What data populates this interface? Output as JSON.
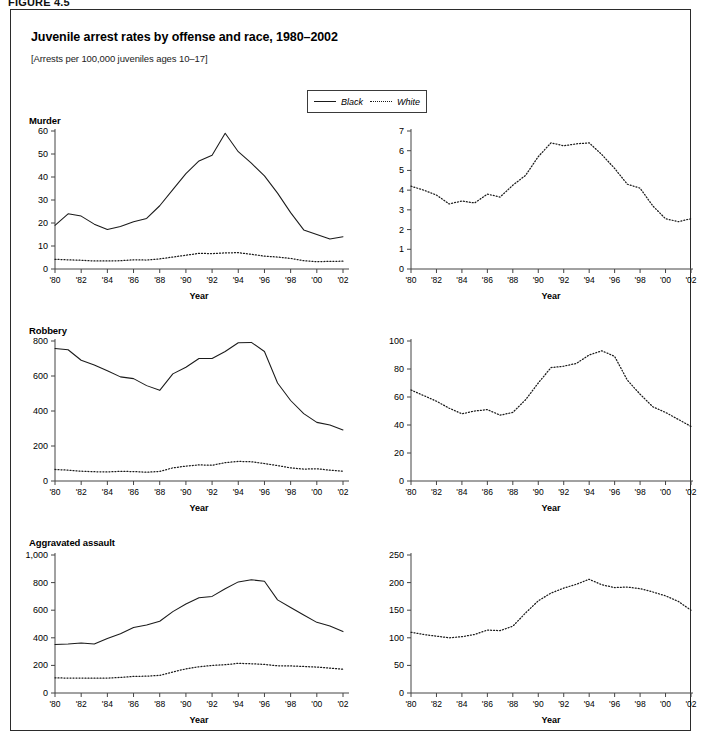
{
  "figure": {
    "label": "FIGURE 4.5",
    "title": "Juvenile arrest rates by offense and race, 1980–2002",
    "subtitle": "[Arrests per 100,000 juveniles ages 10–17]"
  },
  "legend": {
    "position": "top-center",
    "entries": [
      {
        "label": "Black",
        "style": "solid",
        "color": "#1a1a1a"
      },
      {
        "label": "White",
        "style": "dotted",
        "color": "#1a1a1a"
      }
    ]
  },
  "axis": {
    "xlabel": "Year",
    "xticks": [
      "'80",
      "'82",
      "'84",
      "'86",
      "'88",
      "'90",
      "'92",
      "'94",
      "'96",
      "'98",
      "'00",
      "'02"
    ],
    "xtick_years": [
      1980,
      1982,
      1984,
      1986,
      1988,
      1990,
      1992,
      1994,
      1996,
      1998,
      2000,
      2002
    ],
    "xlim": [
      1980,
      2002
    ]
  },
  "chart_data": [
    {
      "id": "murder-both",
      "type": "line",
      "title": "Murder",
      "xlabel": "Year",
      "ylabel": "",
      "ylim": [
        0,
        60
      ],
      "yticks": [
        0,
        10,
        20,
        30,
        40,
        50,
        60
      ],
      "ytick_labels": [
        "0",
        "10",
        "20",
        "30",
        "40",
        "50",
        "60"
      ],
      "grid": false,
      "x": [
        1980,
        1981,
        1982,
        1983,
        1984,
        1985,
        1986,
        1987,
        1988,
        1989,
        1990,
        1991,
        1992,
        1993,
        1994,
        1995,
        1996,
        1997,
        1998,
        1999,
        2000,
        2001,
        2002
      ],
      "series": [
        {
          "name": "Black",
          "style": "solid",
          "values": [
            19.0,
            24.0,
            23.0,
            19.5,
            17.2,
            18.5,
            20.5,
            22.0,
            27.5,
            34.5,
            41.5,
            47.0,
            49.5,
            59.0,
            51.0,
            46.0,
            40.5,
            33.0,
            24.5,
            17.0,
            15.0,
            13.0,
            14.0
          ]
        },
        {
          "name": "White",
          "style": "dotted",
          "values": [
            4.2,
            4.0,
            3.8,
            3.5,
            3.5,
            3.6,
            4.0,
            3.9,
            4.4,
            5.2,
            6.0,
            6.8,
            6.7,
            7.0,
            7.1,
            6.4,
            5.6,
            5.2,
            4.6,
            3.6,
            3.2,
            3.3,
            3.4
          ]
        }
      ]
    },
    {
      "id": "murder-white",
      "type": "line",
      "title": "",
      "xlabel": "Year",
      "ylabel": "",
      "ylim": [
        0,
        7
      ],
      "yticks": [
        0,
        1,
        2,
        3,
        4,
        5,
        6,
        7
      ],
      "ytick_labels": [
        "0",
        "1",
        "2",
        "3",
        "4",
        "5",
        "6",
        "7"
      ],
      "grid": false,
      "x": [
        1980,
        1981,
        1982,
        1983,
        1984,
        1985,
        1986,
        1987,
        1988,
        1989,
        1990,
        1991,
        1992,
        1993,
        1994,
        1995,
        1996,
        1997,
        1998,
        1999,
        2000,
        2001,
        2002
      ],
      "series": [
        {
          "name": "White",
          "style": "dotted",
          "values": [
            4.2,
            4.0,
            3.75,
            3.3,
            3.45,
            3.35,
            3.8,
            3.65,
            4.25,
            4.75,
            5.7,
            6.4,
            6.25,
            6.35,
            6.4,
            5.8,
            5.1,
            4.3,
            4.1,
            3.2,
            2.55,
            2.4,
            2.55
          ]
        }
      ]
    },
    {
      "id": "robbery-both",
      "type": "line",
      "title": "Robbery",
      "xlabel": "Year",
      "ylabel": "",
      "ylim": [
        0,
        800
      ],
      "yticks": [
        0,
        200,
        400,
        600,
        800
      ],
      "ytick_labels": [
        "0",
        "200",
        "400",
        "600",
        "800"
      ],
      "grid": false,
      "x": [
        1980,
        1981,
        1982,
        1983,
        1984,
        1985,
        1986,
        1987,
        1988,
        1989,
        1990,
        1991,
        1992,
        1993,
        1994,
        1995,
        1996,
        1997,
        1998,
        1999,
        2000,
        2001,
        2002
      ],
      "series": [
        {
          "name": "Black",
          "style": "solid",
          "values": [
            757,
            750,
            690,
            663,
            630,
            595,
            585,
            545,
            518,
            612,
            650,
            700,
            700,
            740,
            790,
            792,
            740,
            560,
            460,
            385,
            335,
            320,
            292
          ]
        },
        {
          "name": "White",
          "style": "dotted",
          "values": [
            66,
            62,
            56,
            53,
            52,
            55,
            54,
            50,
            55,
            75,
            85,
            92,
            90,
            105,
            112,
            110,
            100,
            88,
            75,
            68,
            70,
            62,
            56
          ]
        }
      ]
    },
    {
      "id": "robbery-white",
      "type": "line",
      "title": "",
      "xlabel": "Year",
      "ylabel": "",
      "ylim": [
        0,
        100
      ],
      "yticks": [
        0,
        20,
        40,
        60,
        80,
        100
      ],
      "ytick_labels": [
        "0",
        "20",
        "40",
        "60",
        "80",
        "100"
      ],
      "grid": false,
      "x": [
        1980,
        1981,
        1982,
        1983,
        1984,
        1985,
        1986,
        1987,
        1988,
        1989,
        1990,
        1991,
        1992,
        1993,
        1994,
        1995,
        1996,
        1997,
        1998,
        1999,
        2000,
        2001,
        2002
      ],
      "series": [
        {
          "name": "White",
          "style": "dotted",
          "values": [
            65,
            61,
            57,
            52,
            48,
            50,
            51,
            47,
            49,
            58,
            70,
            81,
            82,
            84,
            90,
            93,
            89,
            72,
            62,
            53,
            49,
            44,
            39
          ]
        }
      ]
    },
    {
      "id": "aggravated-assault-both",
      "type": "line",
      "title": "Aggravated assault",
      "xlabel": "Year",
      "ylabel": "",
      "ylim": [
        0,
        1000
      ],
      "yticks": [
        0,
        200,
        400,
        600,
        800,
        1000
      ],
      "ytick_labels": [
        "0",
        "200",
        "400",
        "600",
        "800",
        "1,000"
      ],
      "grid": false,
      "x": [
        1980,
        1981,
        1982,
        1983,
        1984,
        1985,
        1986,
        1987,
        1988,
        1989,
        1990,
        1991,
        1992,
        1993,
        1994,
        1995,
        1996,
        1997,
        1998,
        1999,
        2000,
        2001,
        2002
      ],
      "series": [
        {
          "name": "Black",
          "style": "solid",
          "values": [
            352,
            355,
            363,
            355,
            395,
            430,
            475,
            492,
            520,
            590,
            645,
            690,
            700,
            755,
            805,
            820,
            810,
            675,
            620,
            565,
            512,
            485,
            445
          ]
        },
        {
          "name": "White",
          "style": "dotted",
          "values": [
            110,
            108,
            108,
            107,
            108,
            113,
            120,
            122,
            128,
            152,
            175,
            190,
            200,
            205,
            215,
            212,
            207,
            197,
            196,
            192,
            188,
            180,
            172
          ]
        }
      ]
    },
    {
      "id": "aggravated-assault-white",
      "type": "line",
      "title": "",
      "xlabel": "Year",
      "ylabel": "",
      "ylim": [
        0,
        250
      ],
      "yticks": [
        0,
        50,
        100,
        150,
        200,
        250
      ],
      "ytick_labels": [
        "0",
        "50",
        "100",
        "150",
        "200",
        "250"
      ],
      "grid": false,
      "x": [
        1980,
        1981,
        1982,
        1983,
        1984,
        1985,
        1986,
        1987,
        1988,
        1989,
        1990,
        1991,
        1992,
        1993,
        1994,
        1995,
        1996,
        1997,
        1998,
        1999,
        2000,
        2001,
        2002
      ],
      "series": [
        {
          "name": "White",
          "style": "dotted",
          "values": [
            110,
            106,
            103,
            100,
            102,
            106,
            114,
            113,
            121,
            145,
            167,
            181,
            190,
            197,
            206,
            196,
            191,
            192,
            189,
            183,
            176,
            166,
            150
          ]
        }
      ]
    }
  ]
}
